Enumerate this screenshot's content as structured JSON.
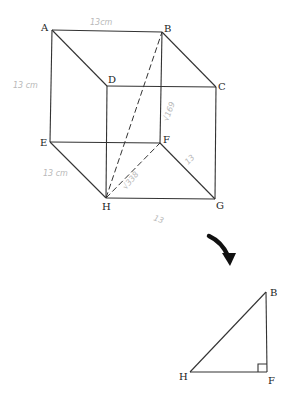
{
  "cube": {
    "vertices": {
      "A": {
        "label": "A",
        "x": 52,
        "y": 30
      },
      "B": {
        "label": "B",
        "x": 162,
        "y": 32
      },
      "C": {
        "label": "C",
        "x": 216,
        "y": 87
      },
      "D": {
        "label": "D",
        "x": 107,
        "y": 86
      },
      "E": {
        "label": "E",
        "x": 50,
        "y": 142
      },
      "F": {
        "label": "F",
        "x": 160,
        "y": 143
      },
      "G": {
        "label": "G",
        "x": 215,
        "y": 199
      },
      "H": {
        "label": "H",
        "x": 106,
        "y": 198
      }
    },
    "annotations": {
      "ab_length": "13cm",
      "ae_length": "13 cm",
      "eh_length": "13 cm",
      "bf_note": "√169",
      "hf_note": "√338",
      "fg_note": "13",
      "hg_note": "13"
    }
  },
  "arrow": {
    "icon": "curved-arrow-down-icon"
  },
  "triangle": {
    "vertices": {
      "B": {
        "label": "B",
        "x": 266,
        "y": 292
      },
      "H": {
        "label": "H",
        "x": 190,
        "y": 372
      },
      "F": {
        "label": "F",
        "x": 267,
        "y": 372
      }
    },
    "right_angle_at": "F"
  },
  "colors": {
    "line": "#333333",
    "handwriting": "#b8b8b8",
    "background": "#ffffff"
  }
}
